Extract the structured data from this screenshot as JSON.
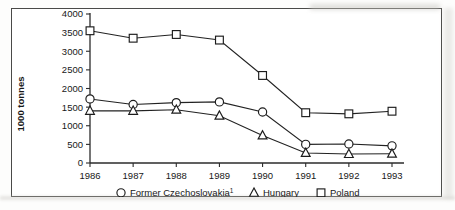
{
  "chart_data": {
    "type": "line",
    "title": "",
    "subtitle": "",
    "xlabel": "",
    "ylabel": "1000 tonnes",
    "categories": [
      "1986",
      "1987",
      "1988",
      "1989",
      "1990",
      "1991",
      "1992",
      "1993"
    ],
    "x": [
      1986,
      1987,
      1988,
      1989,
      1990,
      1991,
      1992,
      1993
    ],
    "xlim": [
      1986,
      1993
    ],
    "ylim": [
      0,
      4000
    ],
    "ytick_labels": [
      "0",
      "500",
      "1000",
      "1500",
      "2000",
      "2500",
      "3000",
      "3500",
      "4000"
    ],
    "ytick_values": [
      0,
      500,
      1000,
      1500,
      2000,
      2500,
      3000,
      3500,
      4000
    ],
    "grid": false,
    "legend_position": "bottom",
    "series": [
      {
        "name": "Former Czechoslovakia",
        "footnote": "1",
        "marker": "circle",
        "values": [
          1720,
          1570,
          1620,
          1640,
          1370,
          500,
          510,
          460
        ]
      },
      {
        "name": "Hungary",
        "footnote": "",
        "marker": "triangle",
        "values": [
          1400,
          1400,
          1430,
          1270,
          740,
          270,
          240,
          250
        ]
      },
      {
        "name": "Poland",
        "footnote": "",
        "marker": "square",
        "values": [
          3550,
          3350,
          3450,
          3300,
          2350,
          1350,
          1320,
          1390
        ]
      }
    ]
  },
  "legend": {
    "items": [
      {
        "marker": "circle",
        "label": "Former Czechoslovakia",
        "sup": "1"
      },
      {
        "marker": "triangle",
        "label": "Hungary",
        "sup": ""
      },
      {
        "marker": "square",
        "label": "Poland",
        "sup": ""
      }
    ]
  },
  "axis": {
    "y_title": "1000 tonnes"
  }
}
